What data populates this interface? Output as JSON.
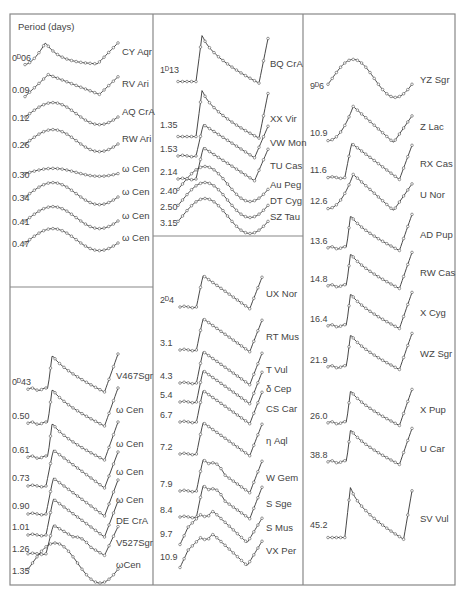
{
  "header": {
    "title": "Period (days)"
  },
  "layout": {
    "frame": {
      "x": 10,
      "y": 14,
      "w": 445,
      "h": 571
    },
    "col_x": [
      10,
      153,
      303,
      455
    ],
    "left_split_y": 287,
    "middle_split_y": 236
  },
  "panels": [
    {
      "id": "left-top",
      "curves": [
        {
          "period": "0ᴰ06",
          "star": "CY Aqr",
          "y": 58,
          "shape": "rr"
        },
        {
          "period": "0.09",
          "star": "RV Ari",
          "y": 90,
          "shape": "rr2"
        },
        {
          "period": "0.12",
          "star": "AQ CrA",
          "y": 118,
          "shape": "sine"
        },
        {
          "period": "0.26",
          "star": "RW Ari",
          "y": 145,
          "shape": "sine"
        },
        {
          "period": "0.30",
          "star": "ω Cen",
          "y": 175,
          "shape": "flat"
        },
        {
          "period": "0.34",
          "star": "ω Cen",
          "y": 198,
          "shape": "sine"
        },
        {
          "period": "0.41",
          "star": "ω Cen",
          "y": 222,
          "shape": "sine"
        },
        {
          "period": "0.47",
          "star": "ω Cen",
          "y": 244,
          "shape": "sine"
        }
      ]
    },
    {
      "id": "left-bottom",
      "curves": [
        {
          "period": "0ᴰ43",
          "star": "V467Sgr",
          "y": 382,
          "shape": "cep_sharp"
        },
        {
          "period": "0.50",
          "star": "ω Cen",
          "y": 416,
          "shape": "cep_sharp"
        },
        {
          "period": "0.61",
          "star": "ω Cen",
          "y": 450,
          "shape": "cep_sharp"
        },
        {
          "period": "0.73",
          "star": "ω Cen",
          "y": 478,
          "shape": "cep"
        },
        {
          "period": "0.90",
          "star": "ω Cen",
          "y": 506,
          "shape": "cep"
        },
        {
          "period": "1.01",
          "star": "DE CrA",
          "y": 527,
          "shape": "cep"
        },
        {
          "period": "1.26",
          "star": "V527Sgr",
          "y": 549,
          "shape": "bump"
        },
        {
          "period": "1.35",
          "star": "ωCen",
          "y": 571,
          "shape": "sine"
        }
      ]
    },
    {
      "id": "middle-top",
      "curves": [
        {
          "period": "1ᴰ13",
          "star": "BQ CrA",
          "y": 70,
          "shape": "cep_big"
        },
        {
          "period": "1.35",
          "star": "XX Vir",
          "y": 125,
          "shape": "cep_big"
        },
        {
          "period": "1.53",
          "star": "VW Mon",
          "y": 149,
          "shape": "cep"
        },
        {
          "period": "2.14",
          "star": "TU Cas",
          "y": 172,
          "shape": "cep"
        },
        {
          "period": "2.40",
          "star": "Au Peg",
          "y": 191,
          "shape": "sine"
        },
        {
          "period": "2.50",
          "star": "DT Cyg",
          "y": 207,
          "shape": "sine"
        },
        {
          "period": "3.15",
          "star": "SZ Tau",
          "y": 223,
          "shape": "sine"
        }
      ]
    },
    {
      "id": "middle-bottom",
      "curves": [
        {
          "period": "2ᴰ4",
          "star": "UX Nor",
          "y": 300,
          "shape": "cep"
        },
        {
          "period": "3.1",
          "star": "RT Mus",
          "y": 343,
          "shape": "cep"
        },
        {
          "period": "4.3",
          "star": "T Vul",
          "y": 376,
          "shape": "cep"
        },
        {
          "period": "5.4",
          "star": "δ Cep",
          "y": 395,
          "shape": "cep"
        },
        {
          "period": "6.7",
          "star": "CS Car",
          "y": 415,
          "shape": "cep"
        },
        {
          "period": "7.2",
          "star": "η Aql",
          "y": 447,
          "shape": "cep"
        },
        {
          "period": "7.9",
          "star": "W Gem",
          "y": 484,
          "shape": "hump"
        },
        {
          "period": "8.4",
          "star": "S Sge",
          "y": 510,
          "shape": "hump"
        },
        {
          "period": "9.7",
          "star": "S Mus",
          "y": 534,
          "shape": "double"
        },
        {
          "period": "10.9",
          "star": "VX Per",
          "y": 557,
          "shape": "double"
        }
      ]
    },
    {
      "id": "right",
      "curves": [
        {
          "period": "9ᴰ6",
          "star": "YZ Sgr",
          "y": 86,
          "shape": "sine"
        },
        {
          "period": "10.9",
          "star": "Z Lac",
          "y": 133,
          "shape": "peak"
        },
        {
          "period": "11.6",
          "star": "RX Cas",
          "y": 170,
          "shape": "cep"
        },
        {
          "period": "12.6",
          "star": "U Nor",
          "y": 201,
          "shape": "peak"
        },
        {
          "period": "13.6",
          "star": "AD Pup",
          "y": 241,
          "shape": "cep_sharp"
        },
        {
          "period": "14.8",
          "star": "RW Cas",
          "y": 279,
          "shape": "cep_sharp"
        },
        {
          "period": "16.4",
          "star": "X Cyg",
          "y": 319,
          "shape": "cep_sharp"
        },
        {
          "period": "21.9",
          "star": "WZ Sgr",
          "y": 360,
          "shape": "cep_sharp"
        },
        {
          "period": "26.0",
          "star": "X Pup",
          "y": 416,
          "shape": "cep_sharp"
        },
        {
          "period": "38.8",
          "star": "U Car",
          "y": 455,
          "shape": "cep_sharp"
        },
        {
          "period": "45.2",
          "star": "SV Vul",
          "y": 525,
          "shape": "cep_big"
        }
      ]
    }
  ]
}
